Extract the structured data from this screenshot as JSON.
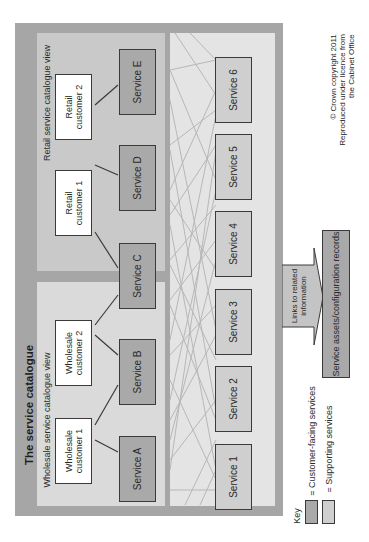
{
  "diagram": {
    "title": "The service catalogue",
    "retail_view_label": "Retail service catalogue view",
    "wholesale_view_label": "Wholesale service catalogue view",
    "customers": [
      {
        "id": "rc2",
        "label": "Retail\ncustomer 2"
      },
      {
        "id": "rc1",
        "label": "Retail\ncustomer 1"
      },
      {
        "id": "wc2",
        "label": "Wholesale\ncustomer 2"
      },
      {
        "id": "wc1",
        "label": "Wholesale\ncustomer 1"
      }
    ],
    "customer_facing_services": [
      {
        "id": "E",
        "label": "Service E"
      },
      {
        "id": "D",
        "label": "Service D"
      },
      {
        "id": "C",
        "label": "Service C"
      },
      {
        "id": "B",
        "label": "Service B"
      },
      {
        "id": "A",
        "label": "Service A"
      }
    ],
    "supporting_services": [
      {
        "id": "6",
        "label": "Service 6"
      },
      {
        "id": "5",
        "label": "Service 5"
      },
      {
        "id": "4",
        "label": "Service 4"
      },
      {
        "id": "3",
        "label": "Service 3"
      },
      {
        "id": "2",
        "label": "Service 2"
      },
      {
        "id": "1",
        "label": "Service 1"
      }
    ],
    "customer_service_links": [
      [
        "Retail customer 2",
        "Service E"
      ],
      [
        "Retail customer 1",
        "Service D"
      ],
      [
        "Retail customer 1",
        "Service C"
      ],
      [
        "Wholesale customer 2",
        "Service C"
      ],
      [
        "Wholesale customer 2",
        "Service B"
      ],
      [
        "Wholesale customer 1",
        "Service B"
      ],
      [
        "Wholesale customer 1",
        "Service A"
      ]
    ],
    "links_arrow_label": "Links to related\ninformation",
    "assets_label": "Service assets/configuration records",
    "copyright": "© Crown copyright 2011\nReproduced under licence from\nthe Cabinet Office",
    "key": {
      "title": "Key",
      "items": [
        {
          "label": "= Customer-facing services",
          "color": "#a9a9a9"
        },
        {
          "label": "= Supporting services",
          "color": "#cfcfcf"
        }
      ]
    },
    "colors": {
      "frame": "#a6a6a6",
      "customer_facing": "#a9a9a9",
      "supporting": "#cfcfcf",
      "customer_box": "#ffffff"
    },
    "orientation": "rotated 90° counter-clockwise"
  }
}
